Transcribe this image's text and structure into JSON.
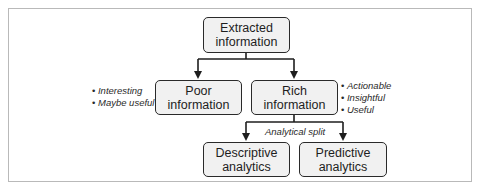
{
  "diagram": {
    "nodes": {
      "root": {
        "label": "Extracted\ninformation"
      },
      "poor": {
        "label": "Poor information"
      },
      "rich": {
        "label": "Rich information"
      },
      "descriptive": {
        "label": "Descriptive\nanalytics"
      },
      "predictive": {
        "label": "Predictive\nanalytics"
      }
    },
    "notes": {
      "poor": [
        "Interesting",
        "Maybe useful"
      ],
      "rich": [
        "Actionable",
        "Insightful",
        "Useful"
      ]
    },
    "edge_labels": {
      "analytical_split": "Analytical split"
    },
    "edges": [
      {
        "from": "root",
        "to": "poor"
      },
      {
        "from": "root",
        "to": "rich"
      },
      {
        "from": "rich",
        "to": "descriptive"
      },
      {
        "from": "rich",
        "to": "predictive"
      }
    ],
    "colors": {
      "node_fill": "#f1f1f1",
      "node_border": "#2a2a2a",
      "frame_border": "#b9b9b9"
    }
  }
}
